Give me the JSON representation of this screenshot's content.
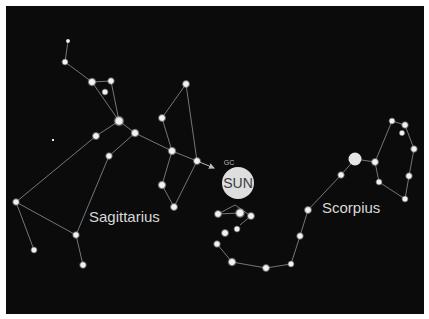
{
  "diagram": {
    "background": "#0b0b0b",
    "line_color": "#9a9a9a",
    "star_color": "#f2f2f2",
    "labels": {
      "sagittarius": "Sagittarius",
      "scorpius": "Scorpius",
      "sun": "SUN",
      "gc": "GC"
    },
    "sun": {
      "cx": 238,
      "cy": 183,
      "r": 16,
      "fill": "#dedede"
    },
    "antares": {
      "cx": 355,
      "cy": 159,
      "r": 6.5
    },
    "stars": [
      [
        68,
        41,
        1.6
      ],
      [
        65,
        62,
        2.4
      ],
      [
        92,
        82,
        3
      ],
      [
        111,
        81,
        2.6
      ],
      [
        105,
        92,
        2.4
      ],
      [
        119,
        121,
        3.6
      ],
      [
        135,
        133,
        3
      ],
      [
        96,
        136,
        2.8
      ],
      [
        109,
        156,
        2.6
      ],
      [
        186,
        84,
        2.8
      ],
      [
        162,
        118,
        2.8
      ],
      [
        172,
        151,
        3
      ],
      [
        197,
        161,
        2.8
      ],
      [
        162,
        185,
        3
      ],
      [
        16,
        202,
        2.6
      ],
      [
        34,
        250,
        2.4
      ],
      [
        76,
        235,
        2.6
      ],
      [
        83,
        265,
        2.6
      ],
      [
        174,
        207,
        2.8
      ],
      [
        218,
        214,
        2.8
      ],
      [
        240,
        213,
        3.4
      ],
      [
        251,
        216,
        2.8
      ],
      [
        237,
        229,
        2.4
      ],
      [
        225,
        233,
        2.8
      ],
      [
        217,
        244,
        2.6
      ],
      [
        232,
        262,
        3
      ],
      [
        266,
        268,
        2.8
      ],
      [
        291,
        264,
        2.4
      ],
      [
        300,
        236,
        2.6
      ],
      [
        308,
        210,
        2.8
      ],
      [
        341,
        175,
        2.6
      ],
      [
        375,
        162,
        2.8
      ],
      [
        379,
        182,
        2.4
      ],
      [
        392,
        121,
        2.4
      ],
      [
        405,
        125,
        2.6
      ],
      [
        402,
        133,
        2.2
      ],
      [
        414,
        149,
        2.6
      ],
      [
        409,
        176,
        2.6
      ],
      [
        405,
        199,
        2.4
      ],
      [
        53,
        140,
        0.9
      ]
    ],
    "lines": [
      [
        68,
        41,
        65,
        62
      ],
      [
        65,
        62,
        92,
        82
      ],
      [
        92,
        82,
        111,
        81
      ],
      [
        92,
        82,
        119,
        121
      ],
      [
        111,
        81,
        119,
        121
      ],
      [
        119,
        121,
        96,
        136
      ],
      [
        96,
        136,
        16,
        202
      ],
      [
        119,
        121,
        135,
        133
      ],
      [
        135,
        133,
        172,
        151
      ],
      [
        135,
        133,
        109,
        156
      ],
      [
        109,
        156,
        76,
        235
      ],
      [
        16,
        202,
        34,
        250
      ],
      [
        16,
        202,
        76,
        235
      ],
      [
        76,
        235,
        83,
        265
      ],
      [
        186,
        84,
        162,
        118
      ],
      [
        162,
        118,
        172,
        151
      ],
      [
        186,
        84,
        197,
        161
      ],
      [
        172,
        151,
        197,
        161
      ],
      [
        172,
        151,
        162,
        185
      ],
      [
        162,
        185,
        174,
        207
      ],
      [
        197,
        161,
        174,
        207
      ],
      [
        218,
        214,
        240,
        213
      ],
      [
        218,
        214,
        235,
        205
      ],
      [
        235,
        205,
        251,
        216
      ],
      [
        251,
        216,
        240,
        225
      ],
      [
        217,
        244,
        232,
        262
      ],
      [
        232,
        262,
        266,
        268
      ],
      [
        266,
        268,
        291,
        264
      ],
      [
        291,
        264,
        300,
        236
      ],
      [
        300,
        236,
        308,
        210
      ],
      [
        308,
        210,
        341,
        175
      ],
      [
        341,
        175,
        355,
        159
      ],
      [
        355,
        159,
        375,
        162
      ],
      [
        375,
        162,
        392,
        121
      ],
      [
        392,
        121,
        405,
        125
      ],
      [
        405,
        125,
        414,
        149
      ],
      [
        414,
        149,
        409,
        176
      ],
      [
        409,
        176,
        405,
        199
      ],
      [
        375,
        162,
        379,
        182
      ],
      [
        379,
        182,
        405,
        199
      ]
    ],
    "arrow": {
      "x1": 197,
      "y1": 161,
      "x2": 214,
      "y2": 168
    }
  }
}
